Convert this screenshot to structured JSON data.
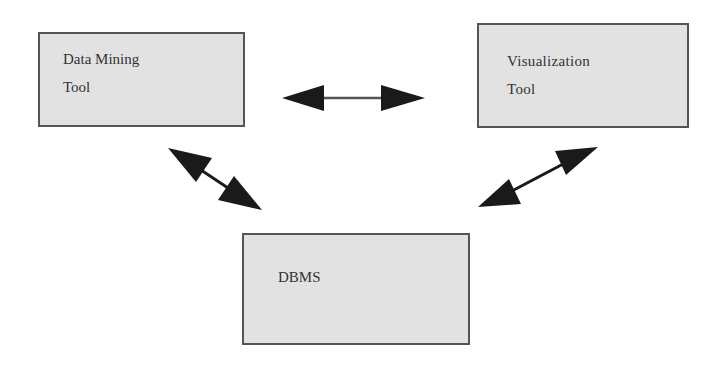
{
  "diagram": {
    "nodes": [
      {
        "id": "data-mining-tool",
        "label": "Data Mining\nTool"
      },
      {
        "id": "visualization-tool",
        "label": "Visualization\nTool"
      },
      {
        "id": "dbms",
        "label": "DBMS"
      }
    ],
    "edges": [
      {
        "from": "data-mining-tool",
        "to": "visualization-tool",
        "type": "bidirectional"
      },
      {
        "from": "data-mining-tool",
        "to": "dbms",
        "type": "bidirectional"
      },
      {
        "from": "visualization-tool",
        "to": "dbms",
        "type": "bidirectional"
      }
    ],
    "colors": {
      "box_fill": "#e2e2e2",
      "box_border": "#555555",
      "arrow": "#1a1a1a",
      "text": "#333333"
    }
  }
}
